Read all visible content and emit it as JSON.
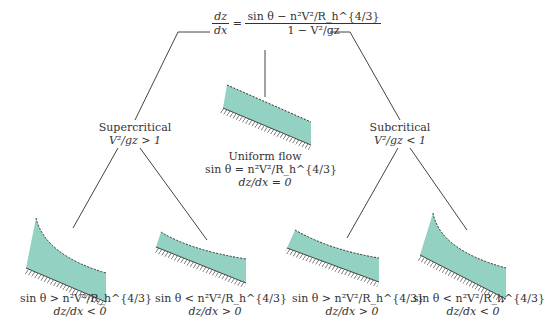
{
  "equation": {
    "lhs_num": "dz",
    "lhs_den": "dx",
    "rhs_num": "sin θ − n²V²/R_h^{4/3}",
    "rhs_den": "1 − V²/gz"
  },
  "colors": {
    "water": "#93d1c3",
    "line": "#444444",
    "bed": "#555555"
  },
  "center": {
    "title": "Uniform flow",
    "condition": "sin θ = n²V²/R_h^{4/3}",
    "slope": "dz/dx = 0"
  },
  "branches": [
    {
      "title": "Supercritical",
      "condition": "V²/gz > 1",
      "cases": [
        {
          "condition": "sin θ > n²V²/R_h^{4/3}",
          "slope": "dz/dx < 0"
        },
        {
          "condition": "sin θ < n²V²/R_h^{4/3}",
          "slope": "dz/dx > 0"
        }
      ]
    },
    {
      "title": "Subcritical",
      "condition": "V²/gz < 1",
      "cases": [
        {
          "condition": "sin θ > n²V²/R_h^{4/3}",
          "slope": "dz/dx > 0"
        },
        {
          "condition": "sin θ < n²V²/R_h^{4/3}",
          "slope": "dz/dx < 0"
        }
      ]
    }
  ]
}
